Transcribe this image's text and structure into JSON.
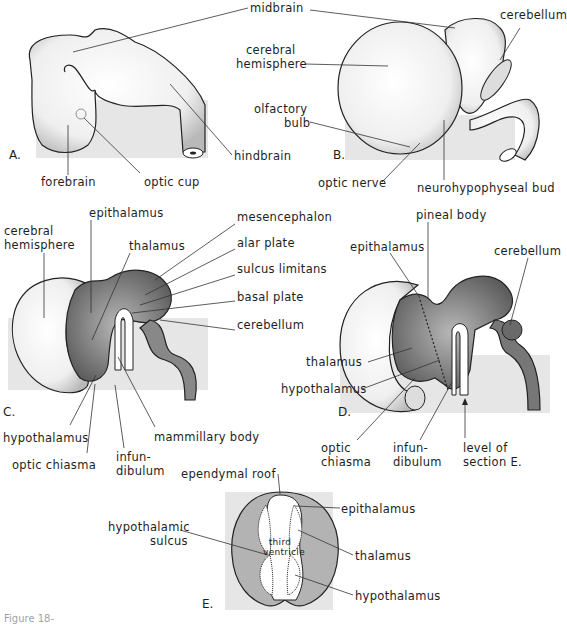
{
  "panels": {
    "A": {
      "letter": "A.",
      "labels": {
        "midbrain": "midbrain",
        "hindbrain": "hindbrain",
        "forebrain": "forebrain",
        "optic_cup": "optic cup"
      }
    },
    "B": {
      "letter": "B.",
      "labels": {
        "cerebellum": "cerebellum",
        "cerebral_hemisphere_1": "cerebral",
        "cerebral_hemisphere_2": "hemisphere",
        "olfactory_bulb_1": "olfactory",
        "olfactory_bulb_2": "bulb",
        "optic_nerve": "optic nerve",
        "neurohypophyseal_bud": "neurohypophyseal bud"
      }
    },
    "C": {
      "letter": "C.",
      "labels": {
        "cerebral_hemisphere_1": "cerebral",
        "cerebral_hemisphere_2": "hemisphere",
        "epithalamus": "epithalamus",
        "thalamus": "thalamus",
        "mesencephalon": "mesencephalon",
        "alar_plate": "alar plate",
        "sulcus_limitans": "sulcus limitans",
        "basal_plate": "basal plate",
        "cerebellum": "cerebellum",
        "hypothalamus": "hypothalamus",
        "optic_chiasma": "optic chiasma",
        "infundibulum_1": "infun-",
        "infundibulum_2": "dibulum",
        "mammillary_body": "mammillary body"
      }
    },
    "D": {
      "letter": "D.",
      "labels": {
        "pineal_body": "pineal body",
        "epithalamus": "epithalamus",
        "cerebellum": "cerebellum",
        "thalamus": "thalamus",
        "hypothalamus": "hypothalamus",
        "optic_chiasma_1": "optic",
        "optic_chiasma_2": "chiasma",
        "infundibulum_1": "infun-",
        "infundibulum_2": "dibulum",
        "level_of_section_1": "level of",
        "level_of_section_2": "section E."
      }
    },
    "E": {
      "letter": "E.",
      "labels": {
        "ependymal_roof": "ependymal roof",
        "epithalamus": "epithalamus",
        "hypothalamic_sulcus_1": "hypothalamic",
        "hypothalamic_sulcus_2": "sulcus",
        "third_ventricle_1": "third",
        "third_ventricle_2": "ventricle",
        "thalamus": "thalamus",
        "hypothalamus": "hypothalamus"
      }
    }
  },
  "caption": "Figure 18-",
  "colors": {
    "tissue_light": "#f2f2f2",
    "tissue_dark": "#8a8a8a",
    "outline": "#222222",
    "background_block": "#e6e6e6",
    "section_gray": "#b3b3b3"
  }
}
